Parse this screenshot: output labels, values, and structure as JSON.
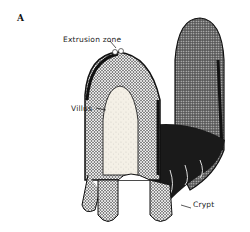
{
  "figure": {
    "panel_label": "A",
    "annotations": [
      {
        "id": "extrusion",
        "text": "Extrusion zone"
      },
      {
        "id": "villus",
        "text": "Villus"
      },
      {
        "id": "crypt",
        "text": "Crypt"
      }
    ],
    "colors": {
      "ink": "#111111",
      "paper": "#ffffff",
      "core": "#f4f0e6"
    }
  }
}
